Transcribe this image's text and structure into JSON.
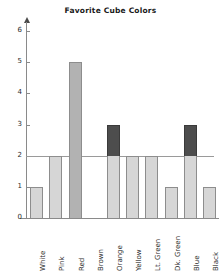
{
  "chart_data": {
    "type": "bar",
    "title": "Favorite Cube Colors",
    "xlabel": "",
    "ylabel": "",
    "categories": [
      "White",
      "Pink",
      "Red",
      "Brown",
      "Orange",
      "Yellow",
      "Lt. Green",
      "Dk. Green",
      "Blue",
      "Black"
    ],
    "values": [
      1,
      2,
      5,
      0,
      3,
      2,
      2,
      1,
      3,
      1
    ],
    "ylim": [
      0,
      6
    ],
    "yticks": [
      0,
      1,
      2,
      3,
      4,
      5,
      6
    ],
    "ytick_labels": [
      "0",
      "1",
      "2",
      "3",
      "4",
      "5",
      "6"
    ],
    "grid": false,
    "reference_line": 2,
    "legend": "none",
    "bar_styles": [
      "light",
      "light",
      "medium",
      "none",
      "light-with-dark-top",
      "light",
      "light",
      "light",
      "light-with-dark-top",
      "light"
    ],
    "colors": {
      "bar_light": "#d6d6d6",
      "bar_medium": "#b2b2b2",
      "bar_dark_top": "#4d4d4d",
      "bar_border": "#8d8d8d",
      "axis": "#8a8a8a",
      "gridline": "#9a9a9a",
      "text": "#2b2b2b",
      "title": "#1a1a1a",
      "background": "#ffffff"
    }
  }
}
